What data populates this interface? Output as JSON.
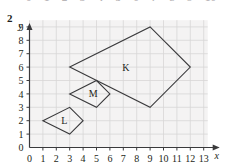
{
  "question_number": "2",
  "top_bleed_labels": [
    "0",
    "1",
    "2",
    "3",
    "4",
    "5",
    "6",
    "7",
    "8",
    "9",
    "10"
  ],
  "chart_data": {
    "type": "scatter",
    "title": "",
    "xlabel": "x",
    "ylabel": "y",
    "xlim": [
      0,
      13
    ],
    "ylim": [
      0,
      9
    ],
    "grid": true,
    "legend": "none",
    "x_ticks": [
      "0",
      "1",
      "2",
      "3",
      "4",
      "5",
      "6",
      "7",
      "8",
      "9",
      "10",
      "11",
      "12",
      "13"
    ],
    "y_ticks": [
      "0",
      "1",
      "2",
      "3",
      "4",
      "5",
      "6",
      "7",
      "8",
      "9"
    ],
    "x_tick_values": [
      0,
      1,
      2,
      3,
      4,
      5,
      6,
      7,
      8,
      9,
      10,
      11,
      12,
      13
    ],
    "y_tick_values": [
      0,
      1,
      2,
      3,
      4,
      5,
      6,
      7,
      8,
      9
    ],
    "shapes": [
      {
        "name": "K",
        "label": "K",
        "label_point": [
          7.2,
          6.0
        ],
        "vertices": [
          [
            3,
            6
          ],
          [
            9,
            9
          ],
          [
            12,
            6
          ],
          [
            9,
            3
          ]
        ],
        "stroke": "#3a3a3c",
        "fill": "none"
      },
      {
        "name": "M",
        "label": "M",
        "label_point": [
          4.75,
          4.05
        ],
        "vertices": [
          [
            3,
            4
          ],
          [
            5,
            5
          ],
          [
            6,
            4
          ],
          [
            5,
            3
          ]
        ],
        "stroke": "#3a3a3c",
        "fill": "none"
      },
      {
        "name": "L",
        "label": "L",
        "label_point": [
          2.6,
          2.05
        ],
        "vertices": [
          [
            1,
            2
          ],
          [
            3,
            3
          ],
          [
            4,
            2
          ],
          [
            3,
            1
          ]
        ],
        "stroke": "#3a3a3c",
        "fill": "none"
      }
    ]
  },
  "colors": {
    "grid_line": "#d8d5d6",
    "plot_background": "#f4f3f3",
    "axis": "#3a3a3c",
    "shape_stroke": "#3a3a3c",
    "text": "#231f20"
  }
}
